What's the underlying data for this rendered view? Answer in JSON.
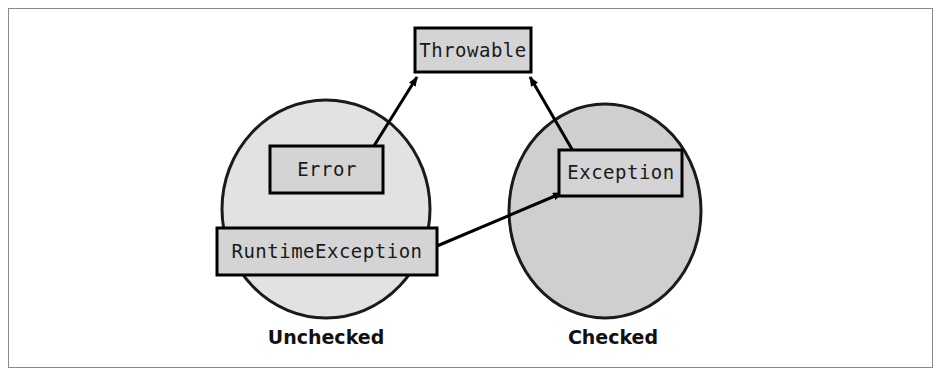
{
  "figure": {
    "border_color": "#8a8a8a",
    "background": "#ffffff"
  },
  "palette": {
    "box_fill": "#d4d4d4",
    "box_stroke": "#000000",
    "unchecked_circle_fill": "#e2e2e2",
    "checked_circle_fill": "#cfcfcf",
    "circle_stroke": "#1a1a1a",
    "arrow_color": "#000000",
    "text_color": "#1a1a1a"
  },
  "regions": [
    {
      "id": "unchecked",
      "label": "Unchecked",
      "fill": "#e2e2e2",
      "cx": 326,
      "cy": 209,
      "rx": 104,
      "ry": 109,
      "label_x": 326,
      "label_y": 344
    },
    {
      "id": "checked",
      "label": "Checked",
      "fill": "#cfcfcf",
      "cx": 605,
      "cy": 211,
      "rx": 96,
      "ry": 107,
      "label_x": 613,
      "label_y": 344
    }
  ],
  "boxes": [
    {
      "id": "throwable",
      "label": "Throwable",
      "x": 415,
      "y": 28,
      "width": 116,
      "height": 44,
      "text_x": 473,
      "text_y": 57
    },
    {
      "id": "error",
      "label": "Error",
      "x": 270,
      "y": 146,
      "width": 113,
      "height": 47,
      "text_x": 327,
      "text_y": 176
    },
    {
      "id": "exception",
      "label": "Exception",
      "x": 559,
      "y": 150,
      "width": 123,
      "height": 46,
      "text_x": 621,
      "text_y": 179
    },
    {
      "id": "runtimeexception",
      "label": "RuntimeException",
      "x": 217,
      "y": 228,
      "width": 220,
      "height": 47,
      "text_x": 327,
      "text_y": 258
    }
  ],
  "arrows": [
    {
      "id": "error-to-throwable",
      "from": "error",
      "to": "throwable",
      "x1": 372,
      "y1": 149,
      "x2": 417,
      "y2": 77
    },
    {
      "id": "exception-to-throwable",
      "from": "exception",
      "to": "throwable",
      "x1": 573,
      "y1": 151,
      "x2": 530,
      "y2": 77
    },
    {
      "id": "runtimeexception-to-exception",
      "from": "runtimeexception",
      "to": "exception",
      "x1": 437,
      "y1": 246,
      "x2": 562,
      "y2": 193
    }
  ]
}
